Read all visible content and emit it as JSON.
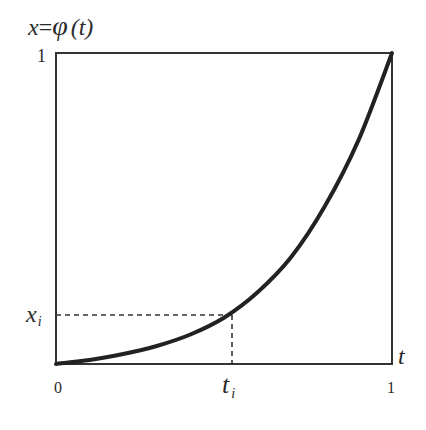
{
  "chart_data": {
    "type": "line",
    "xlabel": "t",
    "ylabel": "x = φ (t)",
    "xlim": [
      0,
      1
    ],
    "ylim": [
      0,
      1
    ],
    "grid": false,
    "x_ticks": [
      "0",
      "1"
    ],
    "y_ticks": [
      "1"
    ],
    "annotations": [
      {
        "label": "x_i",
        "axis": "y",
        "value": 0.16,
        "style": "dashed"
      },
      {
        "label": "t_i",
        "axis": "x",
        "value": 0.52,
        "style": "dashed"
      }
    ],
    "series": [
      {
        "name": "φ(t)",
        "x": [
          0,
          0.1,
          0.2,
          0.3,
          0.4,
          0.5,
          0.6,
          0.7,
          0.8,
          0.9,
          1.0
        ],
        "values": [
          0,
          0.013,
          0.032,
          0.058,
          0.095,
          0.149,
          0.231,
          0.344,
          0.507,
          0.719,
          1.0
        ]
      }
    ]
  },
  "labels": {
    "y_axis_title_x": "x",
    "y_axis_title_eq": "=",
    "y_axis_title_phi": "φ",
    "y_axis_title_arg": "(t)",
    "y_tick_top": "1",
    "x_tick_zero": "0",
    "x_tick_one": "1",
    "x_axis_label": "t",
    "xi_label_main": "x",
    "xi_label_sub": "i",
    "ti_label_main": "t",
    "ti_label_sub": "i"
  },
  "colors": {
    "frame": "#333333",
    "curve": "#222222",
    "dashed": "#333333",
    "text": "#2a2a2a"
  }
}
